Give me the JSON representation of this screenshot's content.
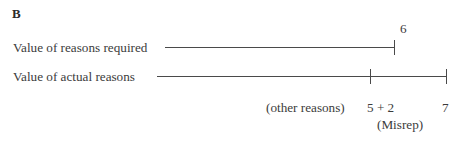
{
  "panel": {
    "letter": "B",
    "background_color": "#ffffff",
    "ink_color": "#3b3b3b",
    "line_color": "#4a4a4a"
  },
  "rows": [
    {
      "label": "Value of reasons required",
      "end_value_label": "6"
    },
    {
      "label": "Value of actual reasons"
    }
  ],
  "annotations": {
    "other_reasons": "(other reasons)",
    "sum_expression": "5 + 2",
    "total": "7",
    "misrep": "(Misrep)"
  },
  "chart_data": {
    "type": "bar",
    "title": "B",
    "xlabel": "",
    "ylabel": "",
    "categories": [
      "Value of reasons required",
      "Value of actual reasons"
    ],
    "values": [
      6,
      7
    ],
    "tick_labels": {
      "required": [
        "6"
      ],
      "actual": [
        "5 + 2",
        "7"
      ]
    },
    "annotations": [
      "(other reasons)",
      "5 + 2",
      "(Misrep)",
      "7"
    ],
    "grid": false,
    "legend": "none"
  }
}
